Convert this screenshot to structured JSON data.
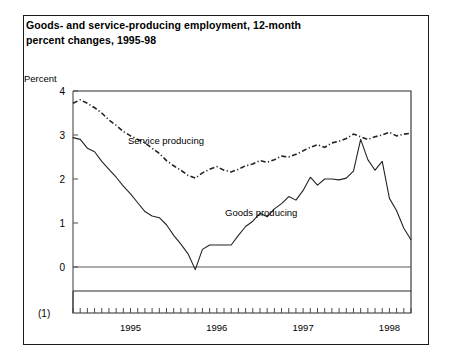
{
  "figure": {
    "title_line1": "Goods- and service-producing employment, 12-month",
    "title_line2": "percent changes, 1995-98",
    "y_axis_title": "Percent",
    "footnote_marker": "(1)"
  },
  "chart_data": {
    "type": "line",
    "title": "Goods- and service-producing employment, 12-month percent changes, 1995-98",
    "xlabel": "",
    "ylabel": "Percent",
    "ylim": [
      0,
      4
    ],
    "xlim": [
      "1994-11",
      "1998-10"
    ],
    "grid": false,
    "legend": "inline-annotations",
    "y_ticks": [
      "0",
      "1",
      "2",
      "3",
      "4"
    ],
    "y_tick_values": [
      0,
      1,
      2,
      3,
      4
    ],
    "x_tick_labels": [
      "1995",
      "1996",
      "1997",
      "1998"
    ],
    "x_tick_label_values": [
      1995,
      1996,
      1997,
      1998
    ],
    "x_minor_ticks_per_year": 12,
    "x": [
      "1994-11",
      "1994-12",
      "1995-01",
      "1995-02",
      "1995-03",
      "1995-04",
      "1995-05",
      "1995-06",
      "1995-07",
      "1995-08",
      "1995-09",
      "1995-10",
      "1995-11",
      "1995-12",
      "1996-01",
      "1996-02",
      "1996-03",
      "1996-04",
      "1996-05",
      "1996-06",
      "1996-07",
      "1996-08",
      "1996-09",
      "1996-10",
      "1996-11",
      "1996-12",
      "1997-01",
      "1997-02",
      "1997-03",
      "1997-04",
      "1997-05",
      "1997-06",
      "1997-07",
      "1997-08",
      "1997-09",
      "1997-10",
      "1997-11",
      "1997-12",
      "1998-01",
      "1998-02",
      "1998-03",
      "1998-04",
      "1998-05",
      "1998-06",
      "1998-07",
      "1998-08",
      "1998-09",
      "1998-10"
    ],
    "series": [
      {
        "name": "Service producing",
        "style": "dash-dot",
        "label_text": "Service producing",
        "values": [
          3.72,
          3.8,
          3.72,
          3.62,
          3.5,
          3.34,
          3.22,
          3.08,
          2.98,
          2.9,
          2.82,
          2.7,
          2.58,
          2.42,
          2.3,
          2.2,
          2.08,
          2.02,
          2.14,
          2.22,
          2.28,
          2.2,
          2.16,
          2.22,
          2.3,
          2.34,
          2.42,
          2.38,
          2.44,
          2.52,
          2.5,
          2.56,
          2.64,
          2.72,
          2.78,
          2.72,
          2.82,
          2.86,
          2.92,
          3.02,
          2.96,
          2.9,
          2.96,
          3.0,
          3.06,
          2.98,
          3.02,
          3.04
        ]
      },
      {
        "name": "Goods producing",
        "style": "solid",
        "label_text": "Goods producing",
        "values": [
          2.94,
          2.9,
          2.7,
          2.62,
          2.4,
          2.22,
          2.04,
          1.84,
          1.66,
          1.46,
          1.26,
          1.16,
          1.12,
          0.96,
          0.72,
          0.52,
          0.3,
          -0.06,
          0.4,
          0.5,
          0.5,
          0.5,
          0.5,
          0.72,
          0.92,
          1.04,
          1.22,
          1.14,
          1.32,
          1.44,
          1.6,
          1.52,
          1.74,
          2.04,
          1.86,
          2.0,
          2.0,
          1.98,
          2.02,
          2.18,
          2.9,
          2.44,
          2.2,
          2.4,
          1.56,
          1.28,
          0.88,
          0.62
        ]
      }
    ],
    "annotations": [
      {
        "text": "Service producing",
        "x_px": 128,
        "y_px": 144
      },
      {
        "text": "Goods producing",
        "x_px": 225,
        "y_px": 216
      }
    ]
  }
}
